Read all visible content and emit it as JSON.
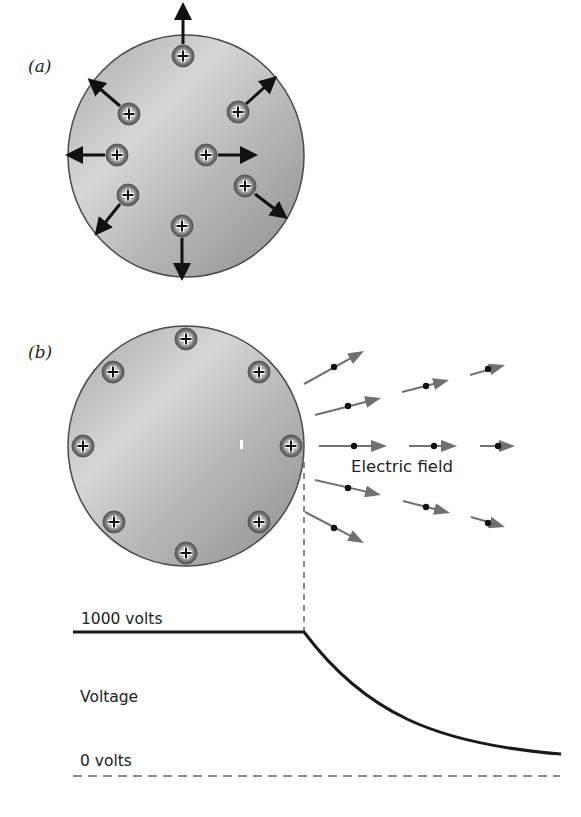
{
  "panel_a": {
    "label": "(a)",
    "sphere": {
      "cx": 186,
      "cy": 156,
      "rx": 118,
      "ry": 121
    },
    "charges": [
      {
        "x": 183,
        "y": 56,
        "arrow": [
          183,
          44,
          183,
          17
        ]
      },
      {
        "x": 129,
        "y": 114,
        "arrow": [
          120,
          106,
          99,
          88
        ]
      },
      {
        "x": 238,
        "y": 112,
        "arrow": [
          246,
          104,
          266,
          86
        ]
      },
      {
        "x": 117,
        "y": 155,
        "arrow": [
          105,
          155,
          80,
          155
        ]
      },
      {
        "x": 206,
        "y": 155,
        "arrow": [
          218,
          155,
          243,
          155
        ]
      },
      {
        "x": 245,
        "y": 186,
        "arrow": [
          255,
          194,
          276,
          210
        ]
      },
      {
        "x": 128,
        "y": 195,
        "arrow": [
          120,
          204,
          104,
          224
        ]
      },
      {
        "x": 182,
        "y": 226,
        "arrow": [
          182,
          238,
          182,
          266
        ]
      }
    ],
    "charge_symbol": "+",
    "arrow_color": "#111111"
  },
  "panel_b": {
    "label": "(b)",
    "sphere": {
      "cx": 186,
      "cy": 446,
      "rx": 118,
      "ry": 120
    },
    "charges": [
      {
        "x": 186,
        "y": 339
      },
      {
        "x": 113,
        "y": 372
      },
      {
        "x": 259,
        "y": 372
      },
      {
        "x": 83,
        "y": 446
      },
      {
        "x": 291,
        "y": 446
      },
      {
        "x": 114,
        "y": 522
      },
      {
        "x": 259,
        "y": 522
      },
      {
        "x": 186,
        "y": 553
      }
    ],
    "charge_symbol": "+",
    "field_label": "Electric field",
    "field_arrow_color": "#707070",
    "field_vectors": [
      {
        "x1": 304,
        "y1": 384,
        "x2": 364,
        "y2": 351,
        "dot": [
          334,
          367
        ]
      },
      {
        "x1": 315,
        "y1": 415,
        "x2": 381,
        "y2": 398,
        "dot": [
          348,
          406
        ]
      },
      {
        "x1": 402,
        "y1": 392,
        "x2": 449,
        "y2": 380,
        "dot": [
          426,
          386
        ]
      },
      {
        "x1": 470,
        "y1": 375,
        "x2": 505,
        "y2": 365,
        "dot": [
          488,
          369
        ]
      },
      {
        "x1": 319,
        "y1": 446,
        "x2": 387,
        "y2": 446,
        "dot": [
          354,
          446
        ]
      },
      {
        "x1": 409,
        "y1": 446,
        "x2": 457,
        "y2": 446,
        "dot": [
          434,
          446
        ]
      },
      {
        "x1": 480,
        "y1": 446,
        "x2": 515,
        "y2": 446,
        "dot": [
          498,
          446
        ]
      },
      {
        "x1": 315,
        "y1": 480,
        "x2": 381,
        "y2": 495,
        "dot": [
          348,
          488
        ]
      },
      {
        "x1": 403,
        "y1": 501,
        "x2": 450,
        "y2": 513,
        "dot": [
          426,
          507
        ]
      },
      {
        "x1": 471,
        "y1": 517,
        "x2": 505,
        "y2": 527,
        "dot": [
          488,
          523
        ]
      },
      {
        "x1": 305,
        "y1": 512,
        "x2": 364,
        "y2": 543,
        "dot": [
          334,
          528
        ]
      }
    ]
  },
  "voltage_graph": {
    "top_label": "1000 volts",
    "axis_label": "Voltage",
    "bottom_label": "0 volts",
    "surface_x": 304,
    "plateau": {
      "x1": 73,
      "x2": 304,
      "y": 632
    },
    "zero_line": {
      "x1": 73,
      "x2": 560,
      "y": 776
    },
    "curve_end": {
      "x": 561,
      "y": 754
    }
  },
  "colors": {
    "sphere_fill_light": "#d4d4d4",
    "sphere_fill_dark": "#9a9a9a",
    "sphere_outline": "#4a4a4a",
    "charge_fill": "#7a7a7a",
    "charge_inner": "#c8c8c8",
    "line_black": "#1a1a1a",
    "dashed_gray": "#6a6a6a"
  }
}
